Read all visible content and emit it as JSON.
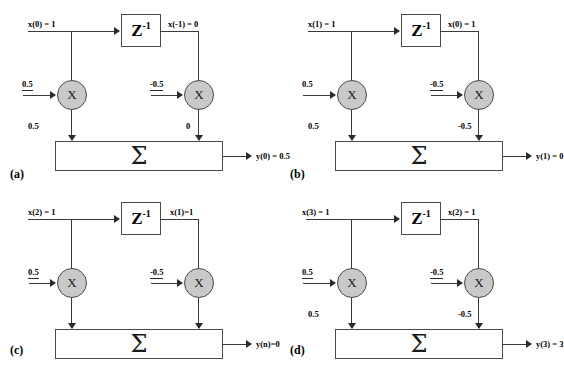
{
  "figure": {
    "type": "signal-flow-diagram",
    "panels": [
      {
        "caption": "(a)",
        "input_label": "x(0) = 1",
        "delay_label": "Z",
        "delay_exponent": "-1",
        "delay_output_label": "x(-1) = 0",
        "left_gain_label": "0.5",
        "right_gain_label": "-0.5",
        "mult_symbol": "X",
        "left_product_label": "0.5",
        "right_product_label": "0",
        "sum_symbol": "Σ",
        "output_label": "y(0) = 0.5"
      },
      {
        "caption": "(b)",
        "input_label": "x(1) = 1",
        "delay_label": "Z",
        "delay_exponent": "-1",
        "delay_output_label": "x(0) = 1",
        "left_gain_label": "0.5",
        "right_gain_label": "-0.5",
        "mult_symbol": "X",
        "left_product_label": "0.5",
        "right_product_label": "-0.5",
        "sum_symbol": "Σ",
        "output_label": "y(1) = 0"
      },
      {
        "caption": "(c)",
        "input_label": "x(2) = 1",
        "delay_label": "Z",
        "delay_exponent": "-1",
        "delay_output_label": "x(1)=1",
        "left_gain_label": "0.5",
        "right_gain_label": "-0.5",
        "mult_symbol": "X",
        "left_product_label": "",
        "right_product_label": "",
        "sum_symbol": "Σ",
        "output_label": "y(n)=0"
      },
      {
        "caption": "(d)",
        "input_label": "x(3) = 1",
        "delay_label": "Z",
        "delay_exponent": "-1",
        "delay_output_label": "x(2) = 1",
        "left_gain_label": "0.5",
        "right_gain_label": "-0.5",
        "mult_symbol": "X",
        "left_product_label": "0.5",
        "right_product_label": "-0.5",
        "sum_symbol": "Σ",
        "output_label": "y(3) = 3"
      }
    ]
  },
  "colors": {
    "wire": "#3a3a3a",
    "multiplier_fill": "#c9c9c9",
    "block_border": "#4a4a4a",
    "background": "#ffffff",
    "text": "#000000"
  }
}
